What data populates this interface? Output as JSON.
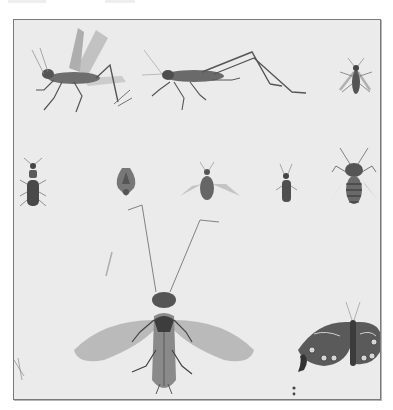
{
  "image": {
    "description": "Engraved natural history plate of insects on a light gray background",
    "background_color": "#ebebeb",
    "border_color": "#7a7a7a",
    "ink_color": "#3a3a3a"
  },
  "specimens": [
    {
      "id": "winged-grasshopper",
      "label": "Grasshopper with spread wings"
    },
    {
      "id": "long-legged-grasshopper",
      "label": "Long-legged grasshopper"
    },
    {
      "id": "small-bug-top-right",
      "label": "Small winged bug"
    },
    {
      "id": "beetle-left",
      "label": "Elongated beetle"
    },
    {
      "id": "shield-bug",
      "label": "Shield bug"
    },
    {
      "id": "winged-fly",
      "label": "Winged fly"
    },
    {
      "id": "small-beetle",
      "label": "Small narrow beetle"
    },
    {
      "id": "bee",
      "label": "Bee"
    },
    {
      "id": "lacewing",
      "label": "Large long-antennae winged insect"
    },
    {
      "id": "moth",
      "label": "Spotted moth"
    },
    {
      "id": "caterpillar",
      "label": "Small dark larva"
    }
  ]
}
